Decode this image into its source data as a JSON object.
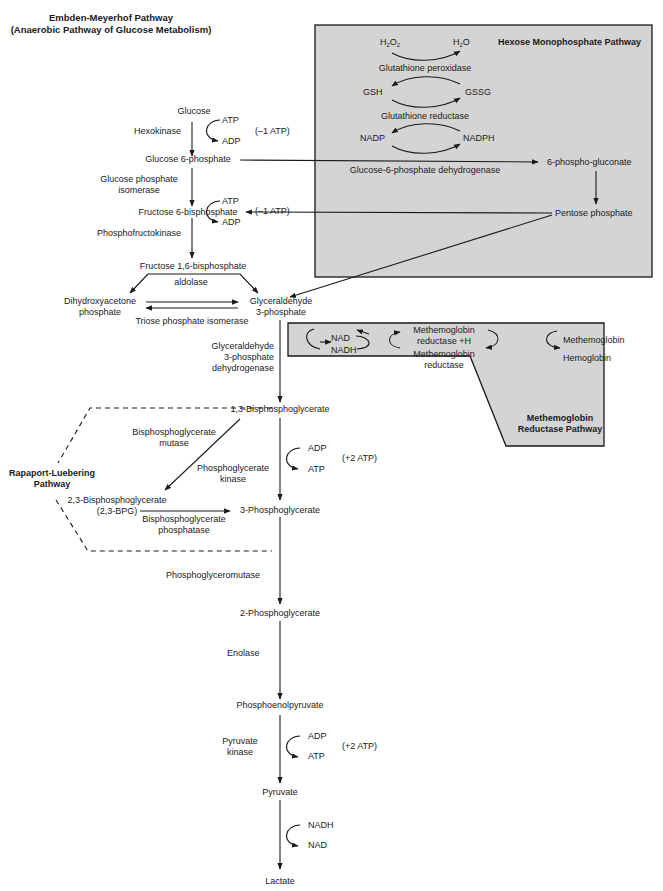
{
  "title": {
    "line1": "Embden-Meyerhof Pathway",
    "line2": "(Anaerobic Pathway of Glucose Metabolism)"
  },
  "colors": {
    "box_fill": "#d4d4d4",
    "line": "#1a1a1a",
    "text": "#1a1a1a",
    "background": "#ffffff"
  },
  "main_pathway": {
    "metabolites": {
      "glucose": "Glucose",
      "glucose6p": "Glucose 6-phosphate",
      "fructose6p": "Fructose 6-bisphosphate",
      "fructose16bp": "Fructose 1,6-bisphosphate",
      "dhap_1": "Dihydroxyacetone",
      "dhap_2": "phosphate",
      "g3p_1": "Glyceraldehyde",
      "g3p_2": "3-phosphate",
      "bpg13": "1,3-Bisphosphoglycerate",
      "pg3": "3-Phosphoglycerate",
      "pg2": "2-Phosphoglycerate",
      "pep": "Phosphoenolpyruvate",
      "pyruvate": "Pyruvate",
      "lactate": "Lactate"
    },
    "enzymes": {
      "hexokinase": "Hexokinase",
      "gpi_1": "Glucose phosphate",
      "gpi_2": "isomerase",
      "pfk": "Phosphofructokinase",
      "aldolase": "aldolase",
      "tpi": "Triose phosphate isomerase",
      "gapdh_1": "Glyceraldehyde",
      "gapdh_2": "3-phosphate",
      "gapdh_3": "dehydrogenase",
      "pgk_1": "Phosphoglycerate",
      "pgk_2": "kinase",
      "pgm": "Phosphoglyceromutase",
      "enolase": "Enolase",
      "pk_1": "Pyruvate",
      "pk_2": "kinase"
    },
    "cofactors": {
      "hk_in": "ATP",
      "hk_out": "ADP",
      "hk_net": "(–1 ATP)",
      "pfk_in": "ATP",
      "pfk_out": "ADP",
      "pfk_net": "(–1 ATP)",
      "pgk_in": "ADP",
      "pgk_out": "ATP",
      "pgk_net": "(+2 ATP)",
      "pk_in": "ADP",
      "pk_out": "ATP",
      "pk_net": "(+2 ATP)",
      "ldh_in": "NADH",
      "ldh_out": "NAD"
    }
  },
  "hmp_pathway": {
    "title": "Hexose Monophosphate Pathway",
    "h2o2": "H2O2",
    "h2o": "H2O",
    "gpx": "Glutathione peroxidase",
    "gsh": "GSH",
    "gssg": "GSSG",
    "gr": "Glutathione reductase",
    "nadp": "NADP",
    "nadph": "NADPH",
    "g6pd": "Glucose-6-phosphate dehydrogenase",
    "phosphogluconate": "6-phospho-gluconate",
    "pentose": "Pentose phosphate"
  },
  "methemoglobin_pathway": {
    "title_1": "Methemoglobin",
    "title_2": "Reductase Pathway",
    "nad": "NAD",
    "nadh": "NADH",
    "mr_h_1": "Methemoglobin",
    "mr_h_2": "reductase +H",
    "mr_1": "Methemoglobin",
    "mr_2": "reductase",
    "methb": "Methemoglobin",
    "hb": "Hemoglobin"
  },
  "rapaport_luebering": {
    "title_1": "Rapaport-Luebering",
    "title_2": "Pathway",
    "bpgm_1": "Bisphosphoglycerate",
    "bpgm_2": "mutase",
    "bpg23_1": "2,3-Bisphosphoglycerate",
    "bpg23_2": "(2,3-BPG)",
    "bpgp_1": "Bisphosphoglycerate",
    "bpgp_2": "phosphatase"
  }
}
